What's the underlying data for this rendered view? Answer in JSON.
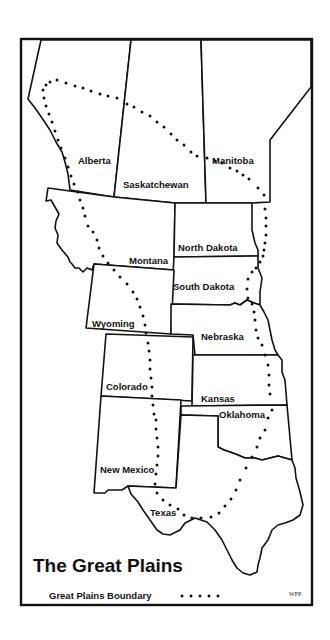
{
  "map": {
    "title": "The Great Plains",
    "legend": {
      "label": "Great Plains Boundary",
      "symbol": "dotted-line",
      "symbol_text": "• • • • •"
    },
    "credit": "WFP",
    "colors": {
      "ink": "#111111",
      "background": "#ffffff"
    },
    "regions": [
      {
        "id": "alberta",
        "name": "Alberta",
        "country": "Canada",
        "type": "province"
      },
      {
        "id": "saskatchewan",
        "name": "Saskatchewan",
        "country": "Canada",
        "type": "province"
      },
      {
        "id": "manitoba",
        "name": "Manitoba",
        "country": "Canada",
        "type": "province"
      },
      {
        "id": "montana",
        "name": "Montana",
        "country": "USA",
        "type": "state"
      },
      {
        "id": "north-dakota",
        "name": "North Dakota",
        "country": "USA",
        "type": "state"
      },
      {
        "id": "south-dakota",
        "name": "South Dakota",
        "country": "USA",
        "type": "state"
      },
      {
        "id": "wyoming",
        "name": "Wyoming",
        "country": "USA",
        "type": "state"
      },
      {
        "id": "nebraska",
        "name": "Nebraska",
        "country": "USA",
        "type": "state"
      },
      {
        "id": "colorado",
        "name": "Colorado",
        "country": "USA",
        "type": "state"
      },
      {
        "id": "kansas",
        "name": "Kansas",
        "country": "USA",
        "type": "state"
      },
      {
        "id": "oklahoma",
        "name": "Oklahoma",
        "country": "USA",
        "type": "state"
      },
      {
        "id": "new-mexico",
        "name": "New Mexico",
        "country": "USA",
        "type": "state"
      },
      {
        "id": "texas",
        "name": "Texas",
        "country": "USA",
        "type": "state"
      }
    ]
  }
}
